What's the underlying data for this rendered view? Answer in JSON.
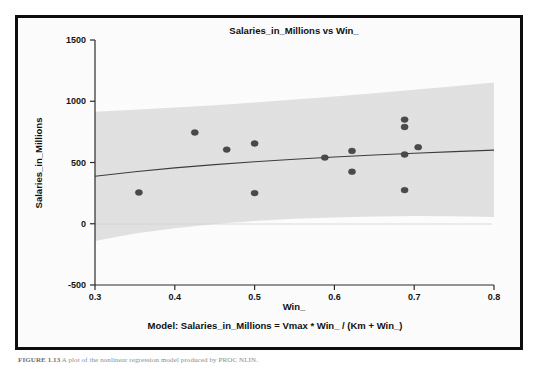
{
  "figure": {
    "title": "Salaries_in_Millions vs Win_",
    "model_text": "Model: Salaries_in_Millions = Vmax * Win_ / (Km + Win_)",
    "caption_label": "FIGURE 1.13",
    "caption_rest": "A plot of the nonlinear regression model produced by PROC NLIN.",
    "border_color": "#0d0d0d",
    "band_color": "#dedede",
    "point_color": "#4a4a4a",
    "line_color": "#3d3d3d"
  },
  "chart_data": {
    "type": "scatter",
    "title": "Salaries_in_Millions vs Win_",
    "xlabel": "Win_",
    "ylabel": "Salaries_in_Millions",
    "xlim": [
      0.3,
      0.8
    ],
    "ylim": [
      -500,
      1500
    ],
    "xticks": [
      0.3,
      0.4,
      0.5,
      0.6,
      0.7,
      0.8
    ],
    "xticklabels": [
      "0.3",
      "0.4",
      "0.5",
      "0.6",
      "0.7",
      "0.8"
    ],
    "yticks": [
      -500,
      0,
      500,
      1000,
      1500
    ],
    "yticklabels": [
      "-500",
      "0",
      "500",
      "1000",
      "1500"
    ],
    "grid": false,
    "legend": null,
    "annotation": "Model: Salaries_in_Millions = Vmax * Win_ / (Km + Win_)",
    "points": [
      {
        "x": 0.355,
        "y": 255
      },
      {
        "x": 0.425,
        "y": 745
      },
      {
        "x": 0.465,
        "y": 605
      },
      {
        "x": 0.5,
        "y": 655
      },
      {
        "x": 0.5,
        "y": 250
      },
      {
        "x": 0.588,
        "y": 540
      },
      {
        "x": 0.622,
        "y": 595
      },
      {
        "x": 0.622,
        "y": 425
      },
      {
        "x": 0.688,
        "y": 850
      },
      {
        "x": 0.688,
        "y": 790
      },
      {
        "x": 0.688,
        "y": 565
      },
      {
        "x": 0.688,
        "y": 275
      },
      {
        "x": 0.705,
        "y": 625
      }
    ],
    "series": [
      {
        "name": "fitted_model",
        "type": "line",
        "x": [
          0.3,
          0.35,
          0.4,
          0.45,
          0.5,
          0.55,
          0.6,
          0.65,
          0.7,
          0.75,
          0.8
        ],
        "values": [
          388,
          425,
          456,
          483,
          506,
          527,
          545,
          561,
          576,
          589,
          601
        ]
      },
      {
        "name": "confidence_band_upper",
        "type": "line",
        "x": [
          0.3,
          0.35,
          0.4,
          0.45,
          0.5,
          0.55,
          0.6,
          0.65,
          0.7,
          0.75,
          0.8
        ],
        "values": [
          915,
          930,
          948,
          968,
          990,
          1014,
          1039,
          1066,
          1094,
          1123,
          1153
        ]
      },
      {
        "name": "confidence_band_lower",
        "type": "line",
        "x": [
          0.3,
          0.35,
          0.4,
          0.45,
          0.5,
          0.55,
          0.6,
          0.65,
          0.7,
          0.75,
          0.8
        ],
        "values": [
          -140,
          -80,
          -36,
          -2,
          22,
          40,
          52,
          60,
          64,
          62,
          55
        ]
      }
    ]
  }
}
